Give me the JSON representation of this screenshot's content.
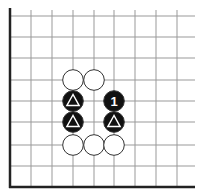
{
  "diagram": {
    "type": "go-board-diagram",
    "caption_fragment": "",
    "board": {
      "corner": "bottom-left",
      "visible_columns": 9,
      "visible_rows": 9,
      "edges": [
        "left",
        "bottom"
      ],
      "line_color": "#999999",
      "edge_color": "#222222",
      "background": "#ffffff"
    },
    "stones": [
      {
        "color": "white",
        "col": 3,
        "row": 3,
        "label": ""
      },
      {
        "color": "white",
        "col": 4,
        "row": 3,
        "label": ""
      },
      {
        "color": "black",
        "col": 3,
        "row": 4,
        "label": "triangle"
      },
      {
        "color": "black",
        "col": 5,
        "row": 4,
        "label": "1"
      },
      {
        "color": "black",
        "col": 3,
        "row": 5,
        "label": "triangle"
      },
      {
        "color": "black",
        "col": 5,
        "row": 5,
        "label": "triangle"
      },
      {
        "color": "white",
        "col": 3,
        "row": 6,
        "label": ""
      },
      {
        "color": "white",
        "col": 4,
        "row": 6,
        "label": ""
      },
      {
        "color": "white",
        "col": 5,
        "row": 6,
        "label": ""
      }
    ],
    "colors": {
      "black_stone": "#111111",
      "white_stone": "#ffffff",
      "stone_outline": "#333333",
      "mark_on_black": "#ffffff"
    }
  }
}
